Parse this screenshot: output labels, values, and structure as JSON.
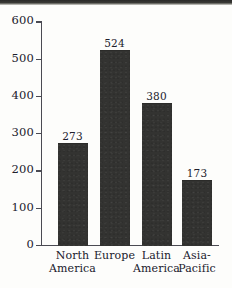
{
  "chart_data": {
    "type": "bar",
    "title": "",
    "subtitle": "",
    "xlabel": "",
    "ylabel": "",
    "categories": [
      "North America",
      "Europe",
      "Latin America",
      "Asia-Pacific"
    ],
    "category_lines": [
      [
        "North",
        "America"
      ],
      [
        "Europe",
        ""
      ],
      [
        "Latin",
        "America"
      ],
      [
        "Asia-",
        "Pacific"
      ]
    ],
    "values": [
      273,
      524,
      380,
      173
    ],
    "value_labels": [
      "273",
      "524",
      "380",
      "173"
    ],
    "ylim": [
      0,
      600
    ],
    "yticks": [
      0,
      100,
      200,
      300,
      400,
      500,
      600
    ],
    "ytick_labels": [
      "600",
      "500",
      "400",
      "300",
      "200",
      "100",
      "0"
    ],
    "grid": false,
    "legend": null,
    "legend_position": "none",
    "bar_color": "#333331",
    "axis_color": "#4a4a52",
    "text_color": "#20202c",
    "background_color": "#fdfdfb"
  }
}
